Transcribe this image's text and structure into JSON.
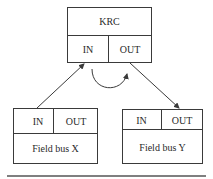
{
  "diagram": {
    "top_box": {
      "title": "KRC",
      "in_label": "IN",
      "out_label": "OUT"
    },
    "left_box": {
      "in_label": "IN",
      "out_label": "OUT",
      "title": "Field bus X"
    },
    "right_box": {
      "in_label": "IN",
      "out_label": "OUT",
      "title": "Field bus Y"
    },
    "edges": [
      {
        "from": "Field bus X",
        "to": "KRC IN"
      },
      {
        "from": "KRC IN",
        "to": "KRC OUT",
        "style": "curved"
      },
      {
        "from": "KRC OUT",
        "to": "Field bus Y"
      }
    ],
    "colors": {
      "stroke": "#3a3a3a",
      "text": "#2a2a2a",
      "background": "#ffffff"
    }
  }
}
